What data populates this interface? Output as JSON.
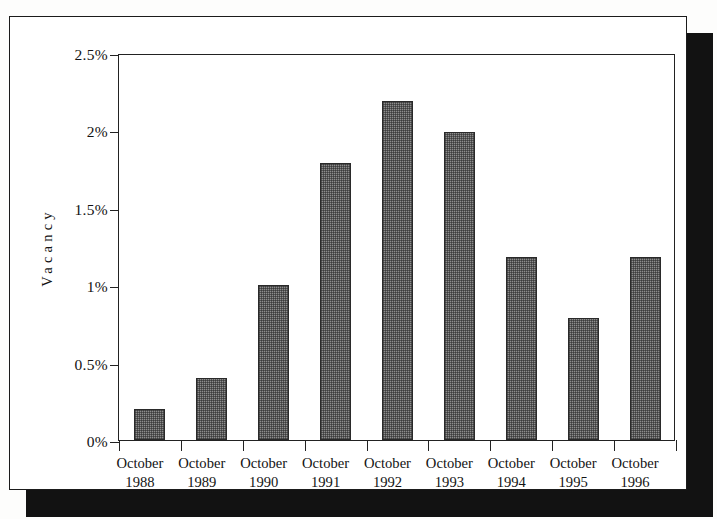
{
  "figure": {
    "frame_color": "#1b1b1b",
    "shadow_color": "#121212",
    "background": "#ffffff"
  },
  "chart_data": {
    "type": "bar",
    "title": "",
    "subtitle": "",
    "xlabel": "",
    "ylabel": "Vacancy",
    "categories": [
      "October 1988",
      "October 1989",
      "October 1990",
      "October 1991",
      "October 1992",
      "October 1993",
      "October 1994",
      "October 1995",
      "October 1996"
    ],
    "category_lines": [
      {
        "month": "October",
        "year": "1988"
      },
      {
        "month": "October",
        "year": "1989"
      },
      {
        "month": "October",
        "year": "1990"
      },
      {
        "month": "October",
        "year": "1991"
      },
      {
        "month": "October",
        "year": "1992"
      },
      {
        "month": "October",
        "year": "1993"
      },
      {
        "month": "October",
        "year": "1994"
      },
      {
        "month": "October",
        "year": "1995"
      },
      {
        "month": "October",
        "year": "1996"
      }
    ],
    "values": [
      0.2,
      0.4,
      1.0,
      1.79,
      2.19,
      1.99,
      1.18,
      0.79,
      1.18
    ],
    "value_unit": "%",
    "ylim": [
      0,
      2.5
    ],
    "yticks": [
      0,
      0.5,
      1,
      1.5,
      2,
      2.5
    ],
    "ytick_labels": [
      "0%",
      "0.5%",
      "1%",
      "1.5%",
      "2%",
      "2.5%"
    ],
    "grid": false,
    "legend": null,
    "bar_fill_color": "#8d8d8d",
    "bar_edge_color": "#2a2a2a",
    "axis_color": "#222222"
  }
}
